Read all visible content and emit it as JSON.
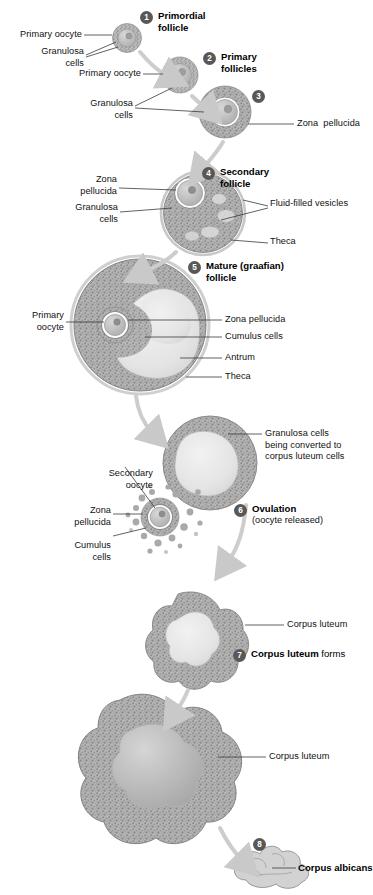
{
  "figure": {
    "type": "biological-process-diagram",
    "palette": {
      "stipple": "#9a9a9a",
      "granulosa_fill": "#b9b9b9",
      "antrum_fill": "#e9e9e9",
      "oocyte_fill": "#c9c9c9",
      "theca_line": "#bdbdbd",
      "arrow": "#c9c9c9",
      "leader": "#3a3a3a",
      "badge_bg": "#585858",
      "badge_text": "#ffffff",
      "text": "#111111",
      "background": "#ffffff"
    }
  },
  "stages": [
    {
      "num": "1",
      "title": "Primordial",
      "title2": "follicle",
      "bold_part": "Primordial follicle",
      "regular_part": ""
    },
    {
      "num": "2",
      "title": "Primary",
      "title2": "follicles",
      "bold_part": "Primary follicles",
      "regular_part": ""
    },
    {
      "num": "3",
      "title": "",
      "title2": "",
      "bold_part": "",
      "regular_part": ""
    },
    {
      "num": "4",
      "title": "Secondary",
      "title2": "follicle",
      "bold_part": "Secondary follicle",
      "regular_part": ""
    },
    {
      "num": "5",
      "title": "Mature (graafian)",
      "title2": "follicle",
      "bold_part": "Mature (graafian) follicle",
      "regular_part": ""
    },
    {
      "num": "6",
      "title": "Ovulation",
      "title2": "",
      "bold_part": "Ovulation",
      "regular_part": "(oocyte released)"
    },
    {
      "num": "7",
      "title": "Corpus luteum",
      "title2": "",
      "bold_part": "Corpus luteum",
      "regular_part": " forms"
    },
    {
      "num": "8",
      "title": "Corpus albicans",
      "title2": "",
      "bold_part": "Corpus albicans",
      "regular_part": ""
    }
  ],
  "labels": {
    "s1_primary_oocyte": "Primary oocyte",
    "s1_granulosa": "Granulosa\ncells",
    "s2_primary_oocyte": "Primary oocyte",
    "s2_granulosa": "Granulosa\ncells",
    "s3_zona": "Zona  pellucida",
    "s4_zona": "Zona\npellucida",
    "s4_granulosa": "Granulosa\ncells",
    "s4_vesicles": "Fluid-filled vesicles",
    "s4_theca": "Theca",
    "s5_primary_oocyte": "Primary\noocyte",
    "s5_zona": "Zona pellucida",
    "s5_cumulus": "Cumulus cells",
    "s5_antrum": "Antrum",
    "s5_theca": "Theca",
    "s6_granulosa_converting": "Granulosa cells\nbeing converted to\ncorpus luteum cells",
    "s6_secondary_oocyte": "Secondary\noocyte",
    "s6_zona": "Zona\npellucida",
    "s6_cumulus": "Cumulus\ncells",
    "s7_corpus_luteum": "Corpus luteum",
    "s7b_corpus_luteum": "Corpus luteum"
  }
}
